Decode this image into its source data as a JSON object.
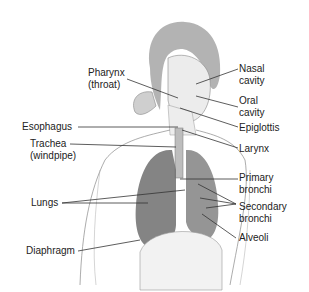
{
  "diagram": {
    "labels": {
      "pharynx": [
        "Pharynx",
        "(throat)"
      ],
      "nasal_cavity": [
        "Nasal",
        "cavity"
      ],
      "oral_cavity": [
        "Oral",
        "cavity"
      ],
      "epiglottis": [
        "Epiglottis"
      ],
      "esophagus": [
        "Esophagus"
      ],
      "trachea": [
        "Trachea",
        "(windpipe)"
      ],
      "larynx": [
        "Larynx"
      ],
      "primary_bronchi": [
        "Primary",
        "bronchi"
      ],
      "lungs": [
        "Lungs"
      ],
      "secondary_bronchi": [
        "Secondary",
        "bronchi"
      ],
      "alveoli": [
        "Alveoli"
      ],
      "diaphragm": [
        "Diaphragm"
      ]
    },
    "colors": {
      "text": "#222222",
      "leader_line": "#333333",
      "figure_outline": "#888888",
      "lung_fill": "#6e6e6e",
      "hair_fill": "#9a9a9a",
      "background": "#ffffff"
    }
  }
}
